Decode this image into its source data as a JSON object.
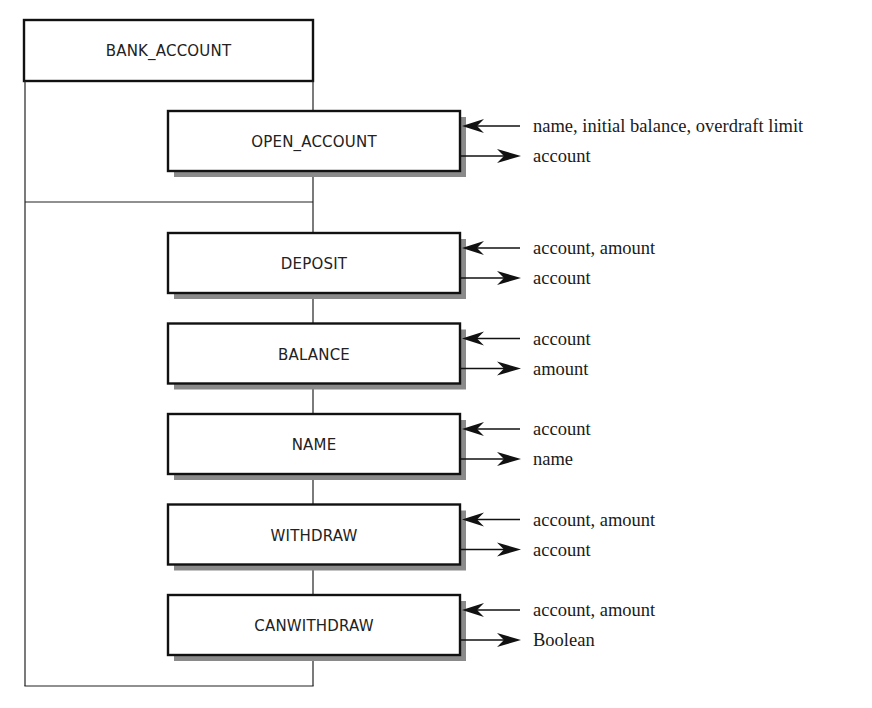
{
  "diagram": {
    "module": {
      "label": "BANK_ACCOUNT"
    },
    "creation_section": {
      "operations": [
        {
          "id": "open-account",
          "label": "OPEN_ACCOUNT",
          "input": "name, initial balance, overdraft limit",
          "output": "account"
        }
      ]
    },
    "operations_section": {
      "operations": [
        {
          "id": "deposit",
          "label": "DEPOSIT",
          "input": "account, amount",
          "output": "account"
        },
        {
          "id": "balance",
          "label": "BALANCE",
          "input": "account",
          "output": "amount"
        },
        {
          "id": "name",
          "label": "NAME",
          "input": "account",
          "output": "name"
        },
        {
          "id": "withdraw",
          "label": "WITHDRAW",
          "input": "account, amount",
          "output": "account"
        },
        {
          "id": "canwithdraw",
          "label": "CANWITHDRAW",
          "input": "account, amount",
          "output": "Boolean"
        }
      ]
    }
  }
}
